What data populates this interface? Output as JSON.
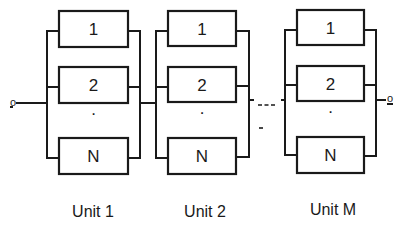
{
  "diagram": {
    "type": "series-parallel reliability block diagram",
    "input_terminal": "o",
    "output_terminal": "o",
    "ellipsis_between_units": "---",
    "units": [
      {
        "label": "Unit 1",
        "components": [
          "1",
          "2",
          "N"
        ],
        "vertical_ellipsis": "·"
      },
      {
        "label": "Unit 2",
        "components": [
          "1",
          "2",
          "N"
        ],
        "vertical_ellipsis": "·"
      },
      {
        "label": "Unit M",
        "components": [
          "1",
          "2",
          "N"
        ],
        "vertical_ellipsis": "·"
      }
    ]
  }
}
